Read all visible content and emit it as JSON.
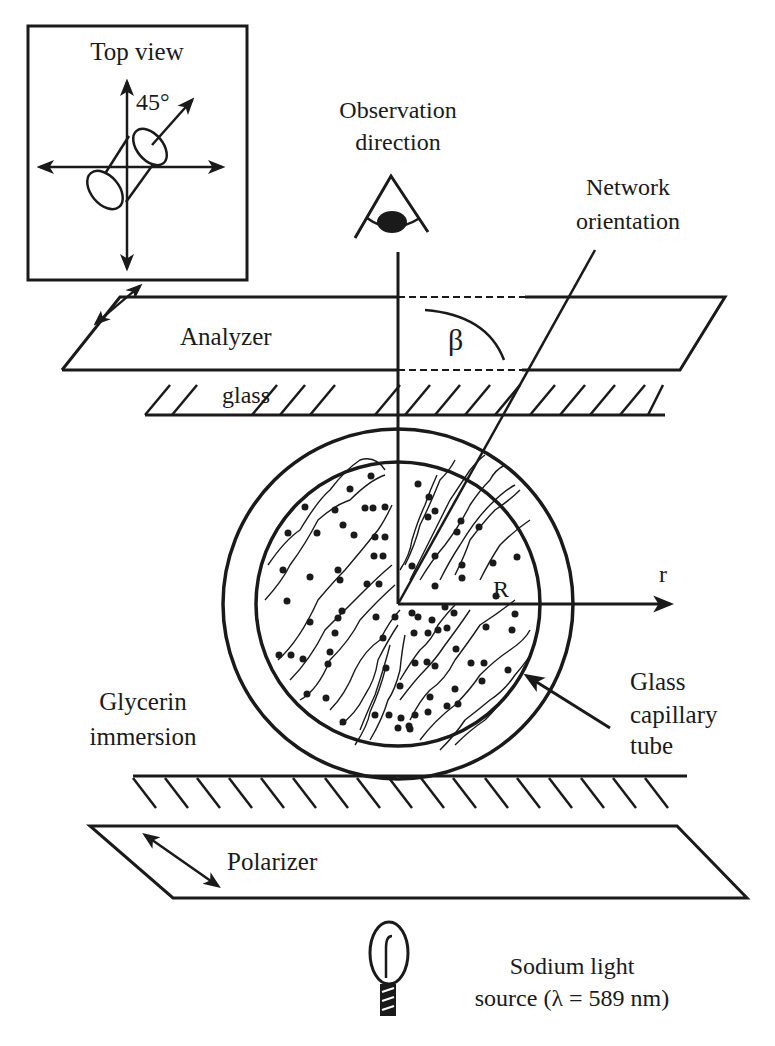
{
  "diagram": {
    "type": "experimental setup schematic",
    "colors": {
      "ink": "#1a1a1a",
      "background": "#ffffff"
    },
    "top_view": {
      "title": "Top view",
      "angle_label": "45°"
    },
    "observation": {
      "line1": "Observation",
      "line2": "direction",
      "icon": "eye-icon"
    },
    "network": {
      "line1": "Network",
      "line2": "orientation"
    },
    "analyzer": {
      "label": "Analyzer",
      "angle_symbol": "β"
    },
    "glass_top": {
      "label": "glass"
    },
    "sample": {
      "radius_label": "R",
      "axis_label": "r"
    },
    "glycerin": {
      "line1": "Glycerin",
      "line2": "immersion"
    },
    "capillary": {
      "line1": "Glass",
      "line2": "capillary",
      "line3": "tube"
    },
    "polarizer": {
      "label": "Polarizer"
    },
    "light_source": {
      "line1": "Sodium light",
      "line2": "source (λ = 589 nm)",
      "icon": "lamp-icon"
    }
  }
}
